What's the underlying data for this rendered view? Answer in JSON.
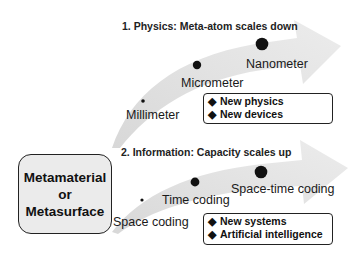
{
  "colors": {
    "arrow_fill": "#e4e4e4",
    "dot": "#111111",
    "box_fill": "#ebebeb",
    "text": "#1a1a1a"
  },
  "source_box": {
    "lines": [
      "Metamaterial",
      "or",
      "Metasurface"
    ]
  },
  "track_physics": {
    "title": "1. Physics: Meta-atom scales down",
    "stages": [
      {
        "label": "Millimeter",
        "dot_size": "small"
      },
      {
        "label": "Micrometer",
        "dot_size": "medium"
      },
      {
        "label": "Nanometer",
        "dot_size": "large"
      }
    ],
    "outcomes": {
      "bullet": "◆",
      "items": [
        "New physics",
        "New devices"
      ]
    }
  },
  "track_information": {
    "title": "2. Information: Capacity scales up",
    "stages": [
      {
        "label": "Space coding",
        "dot_size": "small"
      },
      {
        "label": "Time coding",
        "dot_size": "medium"
      },
      {
        "label": "Space-time coding",
        "dot_size": "large"
      }
    ],
    "outcomes": {
      "bullet": "◆",
      "items": [
        "New systems",
        "Artificial intelligence"
      ]
    }
  }
}
